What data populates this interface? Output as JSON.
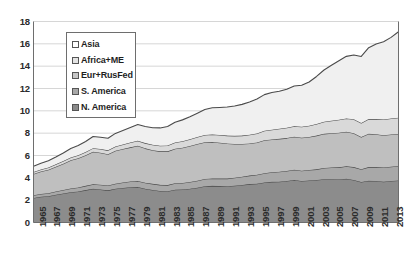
{
  "chart_data": {
    "type": "area",
    "stacked": true,
    "title": "",
    "subtitle": "",
    "xlabel": "",
    "ylabel": "",
    "xlim": [
      1965,
      2014
    ],
    "ylim": [
      0,
      18
    ],
    "ytick_step": 2,
    "grid": true,
    "grid_axis": "y",
    "legend_position": "upper-left-inside",
    "x": [
      1965,
      1966,
      1967,
      1968,
      1969,
      1970,
      1971,
      1972,
      1973,
      1974,
      1975,
      1976,
      1977,
      1978,
      1979,
      1980,
      1981,
      1982,
      1983,
      1984,
      1985,
      1986,
      1987,
      1988,
      1989,
      1990,
      1991,
      1992,
      1993,
      1994,
      1995,
      1996,
      1997,
      1998,
      1999,
      2000,
      2001,
      2002,
      2003,
      2004,
      2005,
      2006,
      2007,
      2008,
      2009,
      2010,
      2011,
      2012,
      2013,
      2014
    ],
    "xtick_labels": [
      "1965",
      "1967",
      "1969",
      "1971",
      "1973",
      "1975",
      "1977",
      "1979",
      "1981",
      "1983",
      "1985",
      "1987",
      "1989",
      "1991",
      "1993",
      "1995",
      "1997",
      "1999",
      "2001",
      "2003",
      "2005",
      "2007",
      "2009",
      "2011",
      "2013"
    ],
    "ytick_labels": [
      "0",
      "2",
      "4",
      "6",
      "8",
      "10",
      "12",
      "14",
      "16",
      "18"
    ],
    "series": [
      {
        "name": "N. America",
        "color": "#8c8c8c",
        "stack_order": 1,
        "values": [
          2.2,
          2.3,
          2.36,
          2.48,
          2.6,
          2.72,
          2.78,
          2.9,
          3.02,
          2.96,
          2.88,
          3.02,
          3.1,
          3.16,
          3.18,
          3.02,
          2.92,
          2.82,
          2.8,
          2.94,
          2.96,
          3.02,
          3.12,
          3.24,
          3.28,
          3.26,
          3.24,
          3.3,
          3.36,
          3.44,
          3.48,
          3.58,
          3.64,
          3.66,
          3.72,
          3.8,
          3.72,
          3.76,
          3.8,
          3.88,
          3.88,
          3.86,
          3.92,
          3.8,
          3.62,
          3.74,
          3.72,
          3.66,
          3.72,
          3.76
        ]
      },
      {
        "name": "S. America",
        "color": "#a8a8a8",
        "stack_order": 2,
        "values": [
          0.24,
          0.26,
          0.27,
          0.29,
          0.31,
          0.33,
          0.35,
          0.38,
          0.41,
          0.42,
          0.43,
          0.46,
          0.48,
          0.51,
          0.53,
          0.54,
          0.54,
          0.55,
          0.55,
          0.57,
          0.58,
          0.61,
          0.63,
          0.65,
          0.66,
          0.67,
          0.69,
          0.71,
          0.73,
          0.76,
          0.79,
          0.83,
          0.87,
          0.89,
          0.9,
          0.92,
          0.92,
          0.94,
          0.96,
          1.0,
          1.04,
          1.08,
          1.12,
          1.16,
          1.15,
          1.22,
          1.24,
          1.26,
          1.28,
          1.3
        ]
      },
      {
        "name": "Eur+RusFed",
        "color": "#bfbfbf",
        "stack_order": 3,
        "values": [
          1.9,
          2.0,
          2.1,
          2.22,
          2.36,
          2.52,
          2.62,
          2.74,
          2.9,
          2.86,
          2.8,
          2.94,
          3.0,
          3.06,
          3.16,
          3.08,
          3.02,
          3.0,
          3.02,
          3.1,
          3.16,
          3.22,
          3.28,
          3.3,
          3.28,
          3.22,
          3.14,
          3.02,
          2.94,
          2.88,
          2.9,
          2.96,
          2.92,
          2.94,
          2.94,
          2.96,
          2.96,
          2.96,
          3.02,
          3.06,
          3.08,
          3.1,
          3.08,
          3.04,
          2.88,
          2.98,
          2.94,
          2.9,
          2.88,
          2.86
        ]
      },
      {
        "name": "Africa+ME",
        "color": "#d9d9d9",
        "stack_order": 4,
        "values": [
          0.18,
          0.19,
          0.2,
          0.22,
          0.24,
          0.26,
          0.28,
          0.3,
          0.33,
          0.34,
          0.35,
          0.38,
          0.4,
          0.43,
          0.46,
          0.47,
          0.48,
          0.5,
          0.52,
          0.55,
          0.57,
          0.6,
          0.62,
          0.65,
          0.67,
          0.69,
          0.71,
          0.73,
          0.75,
          0.78,
          0.81,
          0.84,
          0.87,
          0.9,
          0.92,
          0.95,
          0.97,
          1.0,
          1.04,
          1.08,
          1.12,
          1.16,
          1.2,
          1.24,
          1.26,
          1.32,
          1.36,
          1.4,
          1.44,
          1.46
        ]
      },
      {
        "name": "Asia",
        "color": "#f0f0f0",
        "stack_order": 5,
        "values": [
          0.52,
          0.56,
          0.6,
          0.66,
          0.72,
          0.8,
          0.86,
          0.94,
          1.04,
          1.06,
          1.08,
          1.18,
          1.26,
          1.34,
          1.44,
          1.48,
          1.52,
          1.6,
          1.7,
          1.82,
          1.92,
          2.02,
          2.14,
          2.28,
          2.38,
          2.46,
          2.56,
          2.68,
          2.8,
          2.94,
          3.08,
          3.24,
          3.34,
          3.36,
          3.46,
          3.6,
          3.72,
          3.92,
          4.26,
          4.64,
          4.96,
          5.28,
          5.56,
          5.76,
          5.96,
          6.4,
          6.72,
          6.96,
          7.26,
          7.7
        ]
      }
    ],
    "totals_first": 5.04,
    "totals_last": 17.08
  },
  "legend": {
    "items": [
      {
        "label": "Asia",
        "swatch": "#ffffff"
      },
      {
        "label": "Africa+ME",
        "swatch": "#e3e3e3"
      },
      {
        "label": "Eur+RusFed",
        "swatch": "#c6c6c6"
      },
      {
        "label": "S. America",
        "swatch": "#a8a8a8"
      },
      {
        "label": "N. America",
        "swatch": "#8a8a8a"
      }
    ]
  },
  "axes": {
    "y_ticks": [
      "18",
      "16",
      "14",
      "12",
      "10",
      "8",
      "6",
      "4",
      "2",
      "0"
    ],
    "x_ticks": [
      "1965",
      "1967",
      "1969",
      "1971",
      "1973",
      "1975",
      "1977",
      "1979",
      "1981",
      "1983",
      "1985",
      "1987",
      "1989",
      "1991",
      "1993",
      "1995",
      "1997",
      "1999",
      "2001",
      "2003",
      "2005",
      "2007",
      "2009",
      "2011",
      "2013"
    ]
  },
  "style": {
    "grid_color": "#d6d6d6",
    "axis_color": "#6e6e6e",
    "outline_color": "#4a4a4a",
    "text_color": "#2b2b2b",
    "background": "#ffffff"
  }
}
